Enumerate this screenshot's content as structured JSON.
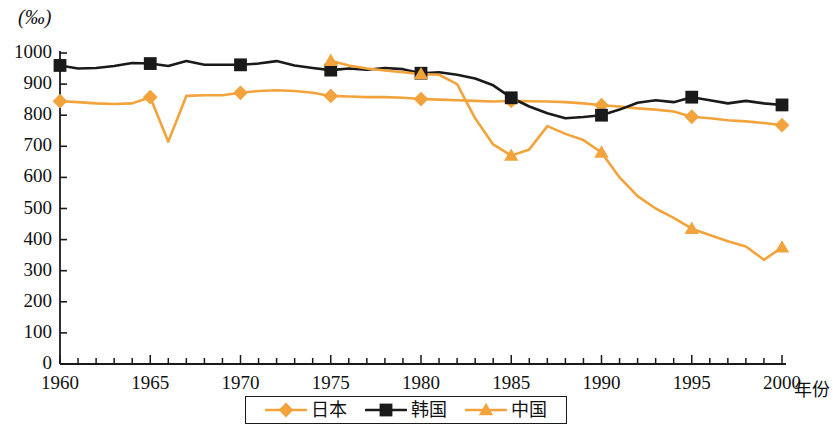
{
  "chart_data": {
    "type": "line",
    "title": "",
    "subtitle": "",
    "unit_label": "(‰)",
    "xlabel": "年份",
    "ylabel": "",
    "xlim": [
      1960,
      2000
    ],
    "ylim": [
      0,
      1000
    ],
    "y_tick_step": 100,
    "x_tick_step": 1,
    "x_label_step": 5,
    "grid": false,
    "legend_position": "bottom-center",
    "y_ticks": [
      0,
      100,
      200,
      300,
      400,
      500,
      600,
      700,
      800,
      900,
      1000
    ],
    "y_tick_labels": [
      "0",
      "100",
      "200",
      "300",
      "400",
      "500",
      "600",
      "700",
      "800",
      "900",
      "1000"
    ],
    "x_ticks": [
      1960,
      1961,
      1962,
      1963,
      1964,
      1965,
      1966,
      1967,
      1968,
      1969,
      1970,
      1971,
      1972,
      1973,
      1974,
      1975,
      1976,
      1977,
      1978,
      1979,
      1980,
      1981,
      1982,
      1983,
      1984,
      1985,
      1986,
      1987,
      1988,
      1989,
      1990,
      1991,
      1992,
      1993,
      1994,
      1995,
      1996,
      1997,
      1998,
      1999,
      2000
    ],
    "x_tick_labels": [
      "1960",
      "1965",
      "1970",
      "1975",
      "1980",
      "1985",
      "1990",
      "1995",
      "2000"
    ],
    "x_labeled_ticks": [
      1960,
      1965,
      1970,
      1975,
      1980,
      1985,
      1990,
      1995,
      2000
    ],
    "series": [
      {
        "name": "日本",
        "key": "japan",
        "color": "#F2A33C",
        "marker": "diamond",
        "marker_years": [
          1960,
          1965,
          1970,
          1975,
          1980,
          1985,
          1990,
          1995,
          2000
        ],
        "x": [
          1960,
          1961,
          1962,
          1963,
          1964,
          1965,
          1966,
          1967,
          1968,
          1969,
          1970,
          1971,
          1972,
          1973,
          1974,
          1975,
          1976,
          1977,
          1978,
          1979,
          1980,
          1981,
          1982,
          1983,
          1984,
          1985,
          1986,
          1987,
          1988,
          1989,
          1990,
          1991,
          1992,
          1993,
          1994,
          1995,
          1996,
          1997,
          1998,
          1999,
          2000
        ],
        "values": [
          845,
          842,
          838,
          836,
          838,
          858,
          715,
          862,
          864,
          864,
          872,
          878,
          880,
          878,
          872,
          862,
          860,
          858,
          858,
          856,
          852,
          850,
          848,
          846,
          844,
          846,
          845,
          844,
          842,
          838,
          832,
          828,
          822,
          818,
          812,
          795,
          790,
          784,
          780,
          775,
          768
        ]
      },
      {
        "name": "韩国",
        "key": "korea",
        "color": "#1A1A1A",
        "marker": "square",
        "marker_years": [
          1960,
          1965,
          1970,
          1975,
          1980,
          1985,
          1990,
          1995,
          2000
        ],
        "x": [
          1960,
          1961,
          1962,
          1963,
          1964,
          1965,
          1966,
          1967,
          1968,
          1969,
          1970,
          1971,
          1972,
          1973,
          1974,
          1975,
          1976,
          1977,
          1978,
          1979,
          1980,
          1981,
          1982,
          1983,
          1984,
          1985,
          1986,
          1987,
          1988,
          1989,
          1990,
          1991,
          1992,
          1993,
          1994,
          1995,
          1996,
          1997,
          1998,
          1999,
          2000
        ],
        "values": [
          960,
          950,
          952,
          958,
          968,
          966,
          958,
          974,
          962,
          962,
          962,
          966,
          974,
          960,
          952,
          945,
          950,
          946,
          952,
          948,
          935,
          938,
          930,
          918,
          896,
          856,
          828,
          806,
          790,
          794,
          800,
          818,
          840,
          848,
          842,
          858,
          848,
          838,
          846,
          838,
          833
        ]
      },
      {
        "name": "中国",
        "key": "china",
        "color": "#F2A33C",
        "marker": "triangle",
        "marker_years": [
          1975,
          1980,
          1985,
          1990,
          1995,
          2000
        ],
        "x": [
          1975,
          1976,
          1977,
          1978,
          1979,
          1980,
          1981,
          1982,
          1983,
          1984,
          1985,
          1986,
          1987,
          1988,
          1989,
          1990,
          1991,
          1992,
          1993,
          1994,
          1995,
          1996,
          1997,
          1998,
          1999,
          2000
        ],
        "values": [
          975,
          960,
          950,
          944,
          938,
          932,
          930,
          900,
          790,
          706,
          670,
          690,
          765,
          740,
          720,
          680,
          600,
          540,
          500,
          470,
          435,
          415,
          395,
          378,
          335,
          375
        ]
      }
    ]
  },
  "legend": {
    "items": [
      {
        "label": "日本",
        "color": "#F2A33C",
        "marker": "diamond"
      },
      {
        "label": "韩国",
        "color": "#1A1A1A",
        "marker": "square"
      },
      {
        "label": "中国",
        "color": "#F2A33C",
        "marker": "triangle"
      }
    ]
  },
  "axes": {
    "unit_caption": "(‰)",
    "x_caption": "年份"
  }
}
